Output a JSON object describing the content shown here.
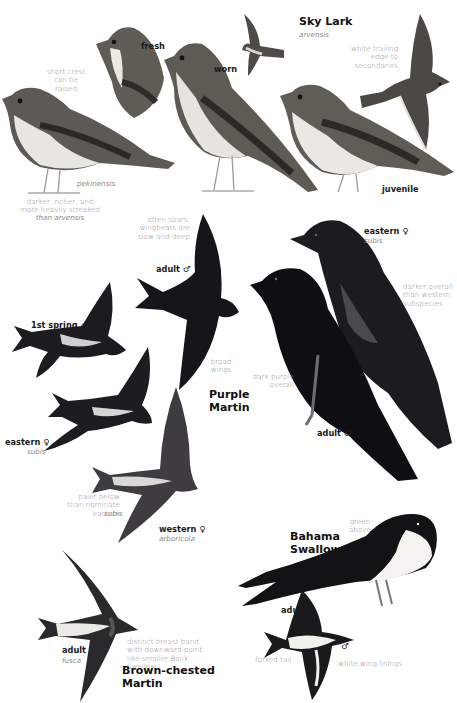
{
  "page": {
    "species": [
      {
        "name": "Sky Lark",
        "subspecies": "arvensis",
        "labels": [
          "fresh",
          "worn",
          "juvenile"
        ],
        "notes": [
          "short crest can be raised",
          "white trailing edge to secondaries"
        ],
        "pekinensis": {
          "name": "pekinensis",
          "note": "darker, richer, and more heavily streaked than arvensis"
        }
      },
      {
        "name": "Purple Martin",
        "labels": [
          "adult ♂",
          "1st spring ♂",
          "eastern ♀",
          "western ♀",
          "adult ♂",
          "eastern ♀"
        ],
        "notes": [
          "often soars; wingbeats are slow and deep",
          "broad wings",
          "paler below than nominate eastern subis",
          "darker overall than western subspecies",
          "dark purple overall"
        ]
      },
      {
        "name": "Brown-chested Martin",
        "labels": [
          "adult"
        ],
        "subspecies": "fusca",
        "notes": [
          "distinct breast band with downward point like smaller Bank Swallow"
        ]
      },
      {
        "name": "Bahama Swallow",
        "labels": [
          "♂",
          "adults",
          "♂"
        ],
        "notes": [
          "green above",
          "forked tail",
          "white wing linings"
        ]
      }
    ]
  },
  "skylark": {
    "title": "Sky Lark",
    "subspecies": "arvensis",
    "fresh": "fresh",
    "worn": "worn",
    "juvenile": "juvenile",
    "crest_note": "short crest can be raised",
    "trailing_note": "white trailing edge to secondaries",
    "pekinensis": "pekinensis",
    "pekinensis_note_1": "darker, richer, and",
    "pekinensis_note_2": "more heavily streaked",
    "pekinensis_note_3": "than arvensis"
  },
  "purple_martin": {
    "title_1": "Purple",
    "title_2": "Martin",
    "flight_adult": "adult ♂",
    "soar_note": "often soars; wingbeats are slow and deep",
    "first_spring": "1st spring ♂",
    "broad_wings": "broad wings",
    "eastern_female_flight": "eastern ♀",
    "eastern_female_flight_sub": "subis",
    "western_female": "western ♀",
    "western_female_sub": "arboricola",
    "paler_note": "paler below than nominate eastern",
    "paler_note_sub": "subis",
    "eastern_female_perched": "eastern ♀",
    "eastern_female_perched_sub": "subis",
    "darker_note": "darker overall than western subspecies",
    "dark_purple_note": "dark purple overall",
    "adult_male_perched": "adult ♂"
  },
  "brown_chested": {
    "title_1": "Brown-chested",
    "title_2": "Martin",
    "adult": "adult",
    "adult_sub": "fusca",
    "band_note": "distinct breast band with downward point like smaller Bank Swallow"
  },
  "bahama": {
    "title_1": "Bahama",
    "title_2": "Swallow",
    "male_perched": "♂",
    "green_note": "green above",
    "adults": "adults",
    "male_flight": "♂",
    "forked_note": "forked tail",
    "wing_note": "white wing linings"
  },
  "colors": {
    "background": "#ffffff",
    "label_text": "#1a1a1a",
    "note_text": "#8a8a8a",
    "martin_dark": "#141318",
    "lark_brown": "#6e6a63"
  }
}
